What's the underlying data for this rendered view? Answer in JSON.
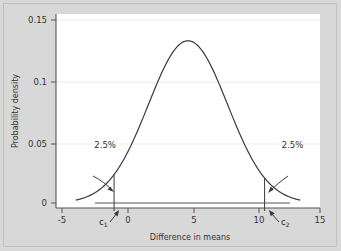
{
  "chart_data": {
    "type": "line",
    "title": "",
    "xlabel": "Difference in means",
    "ylabel": "Probability density",
    "xlim": [
      -5,
      15
    ],
    "ylim": [
      0,
      0.15
    ],
    "grid": true,
    "legend": null,
    "xticks": [
      "-5",
      "0",
      "5",
      "10",
      "15"
    ],
    "xtick_values": [
      -5,
      0,
      5,
      10,
      15
    ],
    "yticks": [
      "0",
      "0.05",
      "0.1",
      "0.15"
    ],
    "ytick_values": [
      0,
      0.05,
      0.1,
      0.15
    ],
    "distribution": {
      "kind": "normal",
      "mean": 5,
      "sd": 3,
      "peak_density": 0.133
    },
    "series": [
      {
        "name": "Sampling distribution of difference in means",
        "x": [
          -3.0,
          -2.5,
          -2.0,
          -1.5,
          -1.0,
          -0.6,
          0.0,
          0.5,
          1.0,
          1.5,
          2.0,
          2.5,
          3.0,
          3.5,
          4.0,
          4.5,
          5.0,
          5.5,
          6.0,
          6.5,
          7.0,
          7.5,
          8.0,
          8.5,
          9.0,
          9.5,
          10.0,
          10.8,
          11.5,
          12.0,
          12.5,
          13.0
        ],
        "y": [
          0.006,
          0.0079,
          0.0104,
          0.0133,
          0.0168,
          0.02,
          0.0255,
          0.0305,
          0.0362,
          0.0424,
          0.0489,
          0.0557,
          0.0625,
          0.069,
          0.075,
          0.0802,
          0.0843,
          0.087,
          0.0881,
          0.087,
          0.0843,
          0.0802,
          0.075,
          0.069,
          0.0625,
          0.0557,
          0.0489,
          0.038,
          0.0275,
          0.0215,
          0.0165,
          0.0122
        ]
      }
    ],
    "annotations": [
      {
        "name": "left-tail-percent",
        "text": "2.5%",
        "x": -2.1,
        "y": 0.0455
      },
      {
        "name": "right-tail-percent",
        "text": "2.5%",
        "x": 12.1,
        "y": 0.0455
      }
    ],
    "critical_values": [
      {
        "name": "c1",
        "label": "c",
        "subscript": "1",
        "x": -0.6
      },
      {
        "name": "c2",
        "label": "c",
        "subscript": "2",
        "x": 10.8
      }
    ]
  },
  "axes": {
    "x_title": "Difference in means",
    "y_title": "Probability density",
    "x_ticks": [
      {
        "label": "-5",
        "value": -5
      },
      {
        "label": "0",
        "value": 0
      },
      {
        "label": "5",
        "value": 5
      },
      {
        "label": "10",
        "value": 10
      },
      {
        "label": "15",
        "value": 15
      }
    ],
    "y_ticks": [
      {
        "label": "0.15",
        "value": 0.15
      },
      {
        "label": "0.1",
        "value": 0.1
      },
      {
        "label": "0.05",
        "value": 0.05
      },
      {
        "label": "0",
        "value": 0
      }
    ]
  },
  "labels": {
    "left_tail": "2.5%",
    "right_tail": "2.5%",
    "c1_base": "c",
    "c1_sub": "1",
    "c2_base": "c",
    "c2_sub": "2"
  },
  "colors": {
    "background": "#d8d8d8",
    "plot_background": "#ffffff",
    "curve": "#3a3a3a",
    "axis": "#555555",
    "grid": "#e8e8e8",
    "text": "#333333"
  }
}
